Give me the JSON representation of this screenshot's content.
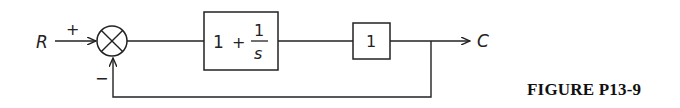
{
  "diagram": {
    "type": "block-diagram",
    "input_label": "R",
    "output_label": "C",
    "sum_junction": {
      "plus_sign": "+",
      "minus_sign": "−"
    },
    "blocks": [
      {
        "id": "controller",
        "integer_part": "1",
        "plus": "+",
        "numerator": "1",
        "denominator": "s"
      },
      {
        "id": "plant",
        "label": "1"
      }
    ],
    "feedback": "unity negative feedback"
  },
  "caption": "FIGURE P13-9",
  "colors": {
    "stroke": "#222222",
    "background": "#ffffff"
  }
}
